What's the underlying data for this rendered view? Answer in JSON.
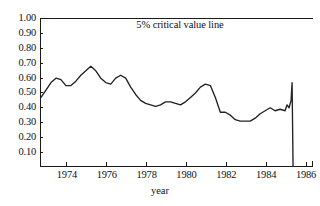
{
  "chart_data": {
    "type": "line",
    "title": "",
    "xlabel": "year",
    "ylabel": "",
    "annotations": [
      {
        "text": "5% critical value line",
        "y": 1.0
      }
    ],
    "grid": false,
    "legend": "none",
    "xlim": [
      1972.65,
      1986.35
    ],
    "ylim": [
      0.0,
      1.02
    ],
    "xticks": [
      1974,
      1976,
      1978,
      1980,
      1982,
      1984,
      1986
    ],
    "xticklabels": [
      "1974",
      "1976",
      "1978",
      "1980",
      "1982",
      "1984",
      "1986"
    ],
    "yticks": [
      0.1,
      0.2,
      0.3,
      0.4,
      0.5,
      0.6,
      0.7,
      0.8,
      0.9,
      1.0
    ],
    "yticklabels": [
      "0.10",
      "0.20",
      "0.30",
      "0.40",
      "0.50",
      "0.60",
      "0.70",
      "0.80",
      "0.90",
      "1.00"
    ],
    "critical_value_line": 1.0,
    "series": [
      {
        "name": "test statistic",
        "color": "#222222",
        "x": [
          1972.7,
          1972.95,
          1973.2,
          1973.45,
          1973.7,
          1973.95,
          1974.2,
          1974.45,
          1974.7,
          1974.95,
          1975.2,
          1975.45,
          1975.7,
          1975.95,
          1976.2,
          1976.45,
          1976.7,
          1976.95,
          1977.2,
          1977.45,
          1977.7,
          1977.95,
          1978.2,
          1978.45,
          1978.7,
          1978.95,
          1979.2,
          1979.45,
          1979.7,
          1979.95,
          1980.2,
          1980.45,
          1980.7,
          1980.95,
          1981.2,
          1981.45,
          1981.7,
          1981.95,
          1982.2,
          1982.45,
          1982.7,
          1982.95,
          1983.2,
          1983.45,
          1983.7,
          1983.95,
          1984.2,
          1984.45,
          1984.7,
          1984.95,
          1985.05,
          1985.15,
          1985.25
        ],
        "y": [
          0.47,
          0.52,
          0.57,
          0.6,
          0.59,
          0.55,
          0.55,
          0.58,
          0.62,
          0.65,
          0.68,
          0.65,
          0.6,
          0.57,
          0.56,
          0.6,
          0.62,
          0.6,
          0.54,
          0.49,
          0.45,
          0.43,
          0.42,
          0.41,
          0.42,
          0.44,
          0.44,
          0.43,
          0.42,
          0.44,
          0.47,
          0.5,
          0.54,
          0.56,
          0.55,
          0.47,
          0.37,
          0.37,
          0.35,
          0.32,
          0.31,
          0.31,
          0.31,
          0.33,
          0.36,
          0.38,
          0.4,
          0.38,
          0.39,
          0.38,
          0.42,
          0.4,
          0.45
        ]
      }
    ],
    "final_drop": {
      "description": "vertical drop to zero after final peak",
      "from": {
        "x": 1985.3,
        "y": 0.57
      },
      "to": {
        "x": 1985.35,
        "y": 0.0
      }
    }
  },
  "axis_labels": {
    "x_title": "year",
    "y_ticks": [
      "1.00",
      "0.90",
      "0.80",
      "0.70",
      "0.60",
      "0.50",
      "0.40",
      "0.30",
      "0.20",
      "0.10"
    ],
    "x_ticks": [
      "1974",
      "1976",
      "1978",
      "1980",
      "1982",
      "1984",
      "1986"
    ]
  },
  "annotation_text": "5% critical value line",
  "colors": {
    "line": "#222222",
    "axis": "#1a1a1a",
    "background": "#ffffff",
    "text": "#111111"
  }
}
